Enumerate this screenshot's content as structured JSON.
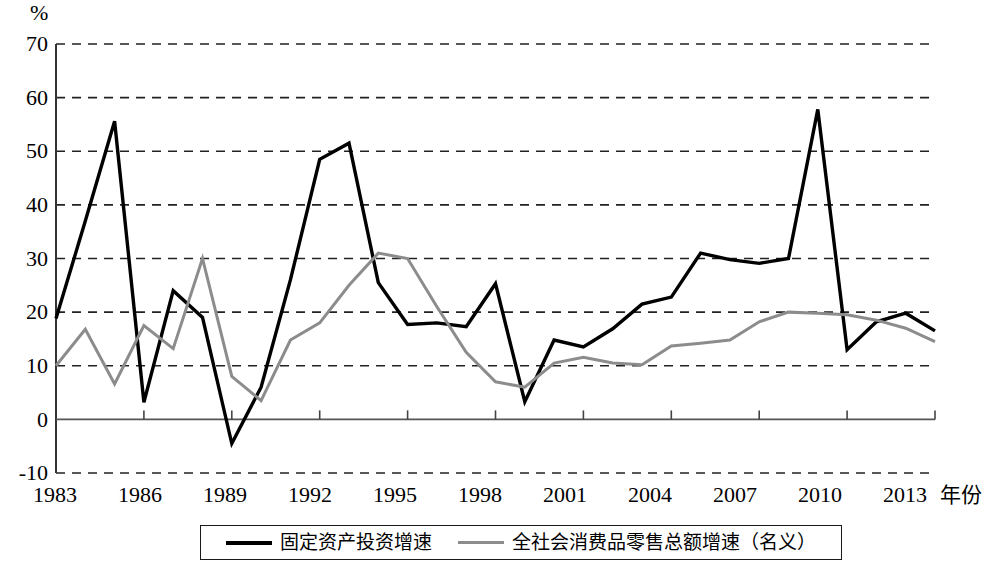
{
  "chart_data": {
    "type": "line",
    "title": "",
    "xlabel": "年份",
    "ylabel": "%",
    "unit_label": "%",
    "ylim": [
      -10,
      70
    ],
    "xlim": [
      1983,
      2013
    ],
    "grid": true,
    "grid_style": "dashed-horizontal",
    "legend_position": "bottom",
    "y_ticks": [
      "70",
      "60",
      "50",
      "40",
      "30",
      "20",
      "10",
      "0",
      "-10"
    ],
    "y_tick_values": [
      70,
      60,
      50,
      40,
      30,
      20,
      10,
      0,
      -10
    ],
    "x_ticks": [
      "1983",
      "1986",
      "1989",
      "1992",
      "1995",
      "1998",
      "2001",
      "2004",
      "2007",
      "2010",
      "2013"
    ],
    "x_tick_values": [
      1983,
      1986,
      1989,
      1992,
      1995,
      1998,
      2001,
      2004,
      2007,
      2010,
      2013
    ],
    "x": [
      1983,
      1984,
      1985,
      1986,
      1987,
      1988,
      1989,
      1990,
      1991,
      1992,
      1993,
      1994,
      1995,
      1996,
      1997,
      1998,
      1999,
      2000,
      2001,
      2002,
      2003,
      2004,
      2005,
      2006,
      2007,
      2008,
      2009,
      2010,
      2011,
      2012,
      2013
    ],
    "series": [
      {
        "name": "固定资产投资增速",
        "color": "#000000",
        "width": 3.4,
        "values": [
          18.8,
          37.0,
          55.6,
          3.2,
          24.0,
          19.0,
          -4.5,
          6.0,
          26.0,
          48.5,
          51.5,
          25.5,
          17.7,
          18.0,
          17.3,
          25.3,
          3.3,
          14.8,
          13.5,
          16.9,
          21.5,
          22.8,
          31.0,
          29.8,
          29.1,
          30.0,
          57.8,
          13.0,
          18.2,
          19.8,
          16.5
        ]
      },
      {
        "name": "全社会消费品零售总额增速（名义）",
        "color": "#8c8c8c",
        "width": 3.0,
        "values": [
          10.0,
          16.8,
          6.6,
          17.5,
          13.2,
          30.0,
          8.0,
          3.5,
          14.8,
          18.0,
          25.0,
          31.0,
          30.0,
          21.0,
          12.5,
          7.0,
          6.0,
          10.5,
          11.6,
          10.5,
          10.2,
          13.7,
          14.2,
          14.8,
          18.2,
          20.0,
          19.8,
          19.5,
          18.5,
          17.0,
          14.5
        ]
      }
    ]
  },
  "legend": {
    "items": [
      {
        "label": "固定资产投资增速",
        "swatch": "black-line"
      },
      {
        "label": "全社会消费品零售总额增速（名义）",
        "swatch": "gray-line"
      }
    ]
  }
}
